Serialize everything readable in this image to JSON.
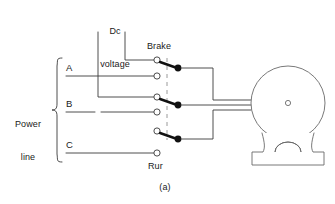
{
  "figure": {
    "caption": "(a)",
    "labels": {
      "dc_voltage": "Dc\nvoltage",
      "dc_voltage_line1": "Dc",
      "dc_voltage_line2": "voltage",
      "brake": "Brake",
      "run": "Rur",
      "power_line_line1": "Power",
      "power_line_line2": "line"
    },
    "phases": [
      {
        "name": "A"
      },
      {
        "name": "B"
      },
      {
        "name": "C"
      }
    ],
    "colors": {
      "line": "#3a3a3a",
      "contact_fill": "#111111",
      "linkage_dash": "#9a9a9a",
      "motor_outline": "#6a6a6a",
      "text": "#1a1a1a",
      "background": "#ffffff"
    },
    "components": {
      "motor": "motor",
      "linkage": "mechanical-linkage",
      "terminal": "terminal",
      "contact": "movable-contact"
    }
  }
}
